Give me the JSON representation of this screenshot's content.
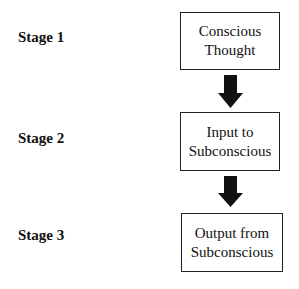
{
  "diagram": {
    "stages": [
      {
        "label": "Stage 1",
        "box_line1": "Conscious",
        "box_line2": "Thought"
      },
      {
        "label": "Stage 2",
        "box_line1": "Input to",
        "box_line2": "Subconscious"
      },
      {
        "label": "Stage 3",
        "box_line1": "Output from",
        "box_line2": "Subconscious"
      }
    ],
    "arrows": [
      {
        "from": "Conscious Thought",
        "to": "Input to Subconscious",
        "icon": "down-arrow-icon"
      },
      {
        "from": "Input to Subconscious",
        "to": "Output from Subconscious",
        "icon": "down-arrow-icon"
      }
    ],
    "colors": {
      "arrow": "#111111",
      "border": "#222222",
      "text": "#111111",
      "background": "#ffffff"
    }
  }
}
